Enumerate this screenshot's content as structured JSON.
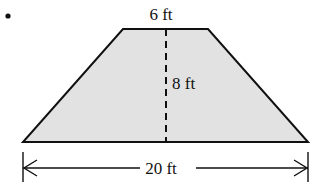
{
  "figure": {
    "kind": "trapezoid-dimension-diagram",
    "bullet": {
      "name": "list-bullet",
      "cx": 8,
      "cy": 16,
      "r": 2.6,
      "color": "#111111"
    },
    "shape": {
      "name": "trapezoid",
      "fill": "#e2e2e2",
      "stroke": "#101010",
      "stroke_width": 2,
      "vertices": [
        {
          "x": 123,
          "y": 29
        },
        {
          "x": 208,
          "y": 29
        },
        {
          "x": 308,
          "y": 142
        },
        {
          "x": 23,
          "y": 142
        }
      ]
    },
    "height_line": {
      "name": "height-dashed-line",
      "x": 166,
      "y1": 29,
      "y2": 142,
      "stroke": "#101010",
      "stroke_width": 2,
      "dash": "7 5"
    },
    "dimension_line": {
      "name": "width-dimension-line",
      "y": 168,
      "x1": 23,
      "x2": 308,
      "stroke": "#101010",
      "stroke_width": 1.4,
      "tick_top": 152,
      "tick_bottom": 182,
      "gap_left": 140,
      "gap_right": 196
    },
    "labels": {
      "top": "6 ft",
      "height": "8 ft",
      "bottom": "20 ft"
    }
  }
}
